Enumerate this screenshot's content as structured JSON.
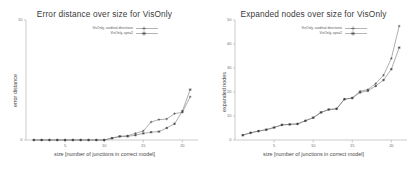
{
  "figure": {
    "background_color": "#ffffff",
    "axis_color": "#b4b4b4",
    "series_color": "#6a6a6a",
    "marker_color": "#3d3d3d"
  },
  "chart_data": [
    {
      "type": "line",
      "title": "Error distance over size for VisOnly",
      "xlabel": "size [number of junctions in correct model]",
      "ylabel": "error distance",
      "xlim": [
        0,
        22
      ],
      "ylim": [
        0,
        10
      ],
      "xticks": [
        5,
        10,
        15,
        20
      ],
      "xtick_labels": [
        "5",
        "10",
        "15",
        "20"
      ],
      "yticks": [
        0,
        10
      ],
      "ytick_labels": [
        "0",
        "10"
      ],
      "grid": false,
      "legend_position": "top-left",
      "marker": "plus",
      "series": [
        {
          "name": "VisOnly, cardinal directions",
          "x": [
            1,
            2,
            3,
            4,
            5,
            6,
            7,
            8,
            9,
            10,
            11,
            12,
            13,
            14,
            15,
            16,
            17,
            18,
            19,
            20,
            21
          ],
          "values": [
            0,
            0,
            0,
            0,
            0,
            0,
            0,
            0,
            0,
            0,
            0.15,
            0.3,
            0.35,
            0.55,
            0.75,
            1.5,
            1.7,
            1.75,
            2.2,
            2.3,
            3.6
          ]
        },
        {
          "name": "VisOnly, apsa2",
          "x": [
            1,
            2,
            3,
            4,
            5,
            6,
            7,
            8,
            9,
            10,
            11,
            12,
            13,
            14,
            15,
            16,
            17,
            18,
            19,
            20,
            21
          ],
          "values": [
            0,
            0,
            0,
            0,
            0,
            0,
            0,
            0,
            0,
            0,
            0.15,
            0.3,
            0.3,
            0.4,
            0.55,
            0.65,
            0.7,
            1.0,
            1.35,
            2.4,
            4.2
          ]
        }
      ]
    },
    {
      "type": "line",
      "title": "Expanded nodes over size for VisOnly",
      "xlabel": "size [number of junctions in correct model]",
      "ylabel": "expanded nodes",
      "xlim": [
        0,
        22
      ],
      "ylim": [
        0,
        50
      ],
      "xticks": [
        5,
        10,
        15,
        20
      ],
      "xtick_labels": [
        "5",
        "10",
        "15",
        "20"
      ],
      "yticks": [
        0,
        10,
        20,
        30,
        40,
        50
      ],
      "ytick_labels": [
        "0",
        "10",
        "20",
        "30",
        "40",
        "50"
      ],
      "grid": false,
      "legend_position": "top-left",
      "marker": "plus",
      "series": [
        {
          "name": "VisOnly, cardinal directions",
          "x": [
            1,
            2,
            3,
            4,
            5,
            6,
            7,
            8,
            9,
            10,
            11,
            12,
            13,
            14,
            15,
            16,
            17,
            18,
            19,
            20,
            21
          ],
          "values": [
            2.0,
            3.0,
            3.7,
            4.3,
            5.2,
            6.3,
            6.5,
            6.7,
            8.0,
            9.3,
            11.5,
            12.7,
            13.0,
            17.0,
            17.5,
            20.3,
            21.0,
            23.5,
            27.0,
            34.0,
            47.5
          ]
        },
        {
          "name": "VisOnly, apsa2",
          "x": [
            1,
            2,
            3,
            4,
            5,
            6,
            7,
            8,
            9,
            10,
            11,
            12,
            13,
            14,
            15,
            16,
            17,
            18,
            19,
            20,
            21
          ],
          "values": [
            2.0,
            3.0,
            3.7,
            4.3,
            5.2,
            6.3,
            6.5,
            6.7,
            8.0,
            9.3,
            11.5,
            12.7,
            13.0,
            17.0,
            17.5,
            19.8,
            20.5,
            22.5,
            25.0,
            29.5,
            38.5
          ]
        }
      ]
    }
  ]
}
